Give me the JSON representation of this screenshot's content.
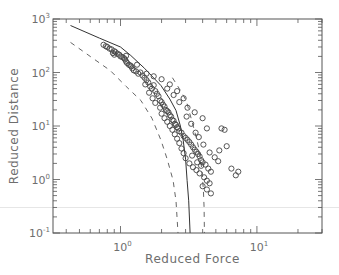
{
  "chart_data": {
    "type": "scatter",
    "title": "",
    "xlabel": "Reduced Force",
    "ylabel": "Reduced Distance",
    "xscale": "log",
    "yscale": "log",
    "xlim": [
      0.32,
      30
    ],
    "ylim": [
      0.1,
      1000
    ],
    "grid": false,
    "legend": "none",
    "x_ticks": [
      {
        "base": "10",
        "exp": "0",
        "value": 1
      },
      {
        "base": "10",
        "exp": "1",
        "value": 10
      }
    ],
    "y_ticks": [
      {
        "base": "10",
        "exp": "-1",
        "value": 0.1
      },
      {
        "base": "10",
        "exp": "0",
        "value": 1
      },
      {
        "base": "10",
        "exp": "1",
        "value": 10
      },
      {
        "base": "10",
        "exp": "2",
        "value": 100
      },
      {
        "base": "10",
        "exp": "3",
        "value": 1000
      }
    ],
    "reference_line": {
      "y": 0.3
    },
    "series": [
      {
        "name": "model",
        "style": "solid",
        "points": [
          [
            0.43,
            755
          ],
          [
            0.7,
            440
          ],
          [
            1.0,
            300
          ],
          [
            1.19,
            208
          ],
          [
            1.5,
            120
          ],
          [
            1.98,
            57
          ],
          [
            2.3,
            32
          ],
          [
            2.55,
            19.5
          ],
          [
            2.75,
            10
          ],
          [
            2.88,
            5.4
          ],
          [
            3.0,
            2.4
          ],
          [
            3.08,
            0.96
          ],
          [
            3.16,
            0.4
          ],
          [
            3.24,
            0.1
          ]
        ]
      },
      {
        "name": "lower-bound",
        "style": "dashed",
        "points": [
          [
            0.43,
            365
          ],
          [
            0.6,
            200
          ],
          [
            0.84,
            109
          ],
          [
            1.1,
            55
          ],
          [
            1.41,
            30
          ],
          [
            1.7,
            14
          ],
          [
            1.98,
            5.4
          ],
          [
            2.2,
            2.4
          ],
          [
            2.43,
            0.96
          ],
          [
            2.55,
            0.4
          ],
          [
            2.64,
            0.1
          ]
        ]
      },
      {
        "name": "upper-bound",
        "style": "dashed",
        "points": [
          [
            2.4,
            80
          ],
          [
            2.7,
            50
          ],
          [
            3.03,
            30
          ],
          [
            3.35,
            12
          ],
          [
            3.6,
            6
          ],
          [
            3.78,
            3.5
          ],
          [
            3.95,
            1.5
          ],
          [
            4.05,
            0.62
          ],
          [
            4.1,
            0.3
          ],
          [
            4.12,
            0.1
          ]
        ]
      },
      {
        "name": "observations",
        "style": "circles",
        "points": [
          [
            0.75,
            330
          ],
          [
            0.78,
            310
          ],
          [
            0.8,
            300
          ],
          [
            0.83,
            280
          ],
          [
            0.86,
            270
          ],
          [
            0.9,
            250
          ],
          [
            0.92,
            240
          ],
          [
            0.95,
            225
          ],
          [
            0.98,
            215
          ],
          [
            1.0,
            200
          ],
          [
            1.03,
            195
          ],
          [
            1.06,
            185
          ],
          [
            0.9,
            215
          ],
          [
            0.88,
            230
          ],
          [
            1.08,
            175
          ],
          [
            1.1,
            160
          ],
          [
            1.12,
            150
          ],
          [
            1.15,
            140
          ],
          [
            1.18,
            135
          ],
          [
            1.2,
            130
          ],
          [
            1.1,
            205
          ],
          [
            1.22,
            120
          ],
          [
            1.25,
            110
          ],
          [
            1.3,
            105
          ],
          [
            1.35,
            95
          ],
          [
            1.32,
            140
          ],
          [
            1.4,
            100
          ],
          [
            1.45,
            88
          ],
          [
            1.5,
            80
          ],
          [
            1.55,
            72
          ],
          [
            1.6,
            65
          ],
          [
            1.52,
            60
          ],
          [
            1.65,
            55
          ],
          [
            1.7,
            50
          ],
          [
            1.75,
            58
          ],
          [
            1.8,
            45
          ],
          [
            1.62,
            42
          ],
          [
            1.85,
            40
          ],
          [
            1.9,
            36
          ],
          [
            1.72,
            33
          ],
          [
            1.95,
            30
          ],
          [
            2.0,
            28
          ],
          [
            1.8,
            27
          ],
          [
            2.05,
            25
          ],
          [
            2.1,
            23
          ],
          [
            1.95,
            22
          ],
          [
            2.15,
            20
          ],
          [
            2.2,
            19
          ],
          [
            2.25,
            18
          ],
          [
            2.0,
            17
          ],
          [
            2.3,
            16
          ],
          [
            2.35,
            15
          ],
          [
            2.1,
            14
          ],
          [
            2.4,
            13
          ],
          [
            2.45,
            12.5
          ],
          [
            2.2,
            12
          ],
          [
            2.5,
            11
          ],
          [
            2.55,
            10.5
          ],
          [
            2.3,
            10
          ],
          [
            2.6,
            9.5
          ],
          [
            2.65,
            9
          ],
          [
            2.4,
            8.5
          ],
          [
            2.7,
            8
          ],
          [
            2.8,
            7.5
          ],
          [
            2.5,
            7
          ],
          [
            2.9,
            6.5
          ],
          [
            3.0,
            6
          ],
          [
            2.6,
            5.8
          ],
          [
            3.1,
            5.5
          ],
          [
            3.2,
            5
          ],
          [
            2.7,
            4.8
          ],
          [
            3.3,
            4.5
          ],
          [
            3.4,
            4
          ],
          [
            2.8,
            3.8
          ],
          [
            3.5,
            3.6
          ],
          [
            3.6,
            3.3
          ],
          [
            2.9,
            3.1
          ],
          [
            3.7,
            3
          ],
          [
            3.8,
            2.7
          ],
          [
            3.0,
            2.5
          ],
          [
            3.9,
            2.3
          ],
          [
            4.0,
            2.1
          ],
          [
            3.2,
            2.0
          ],
          [
            4.2,
            1.9
          ],
          [
            3.4,
            1.7
          ],
          [
            4.4,
            1.6
          ],
          [
            3.6,
            1.5
          ],
          [
            4.6,
            1.4
          ],
          [
            3.8,
            1.3
          ],
          [
            4.1,
            1.1
          ],
          [
            4.3,
            0.95
          ],
          [
            4.5,
            0.85
          ],
          [
            4.0,
            0.75
          ],
          [
            4.3,
            0.65
          ],
          [
            4.6,
            0.55
          ],
          [
            2.3,
            60
          ],
          [
            2.6,
            45
          ],
          [
            2.9,
            33
          ],
          [
            3.1,
            22
          ],
          [
            3.5,
            18
          ],
          [
            4.0,
            14
          ],
          [
            4.3,
            9
          ],
          [
            5.5,
            9
          ],
          [
            5.8,
            8.5
          ],
          [
            6.0,
            4.2
          ],
          [
            5.3,
            3.5
          ],
          [
            6.5,
            1.6
          ],
          [
            7.3,
            1.4
          ],
          [
            7.0,
            1.2
          ],
          [
            1.55,
            95
          ],
          [
            1.75,
            85
          ],
          [
            2.0,
            75
          ],
          [
            2.2,
            50
          ],
          [
            2.45,
            38
          ],
          [
            2.7,
            28
          ],
          [
            3.05,
            15
          ],
          [
            3.3,
            11
          ],
          [
            3.55,
            7.5
          ],
          [
            3.75,
            6.2
          ],
          [
            4.05,
            4.5
          ],
          [
            4.5,
            3.2
          ],
          [
            4.9,
            2.6
          ],
          [
            5.2,
            2.2
          ],
          [
            3.35,
            2.8
          ],
          [
            3.65,
            2.1
          ],
          [
            3.9,
            1.8
          ]
        ]
      }
    ]
  }
}
